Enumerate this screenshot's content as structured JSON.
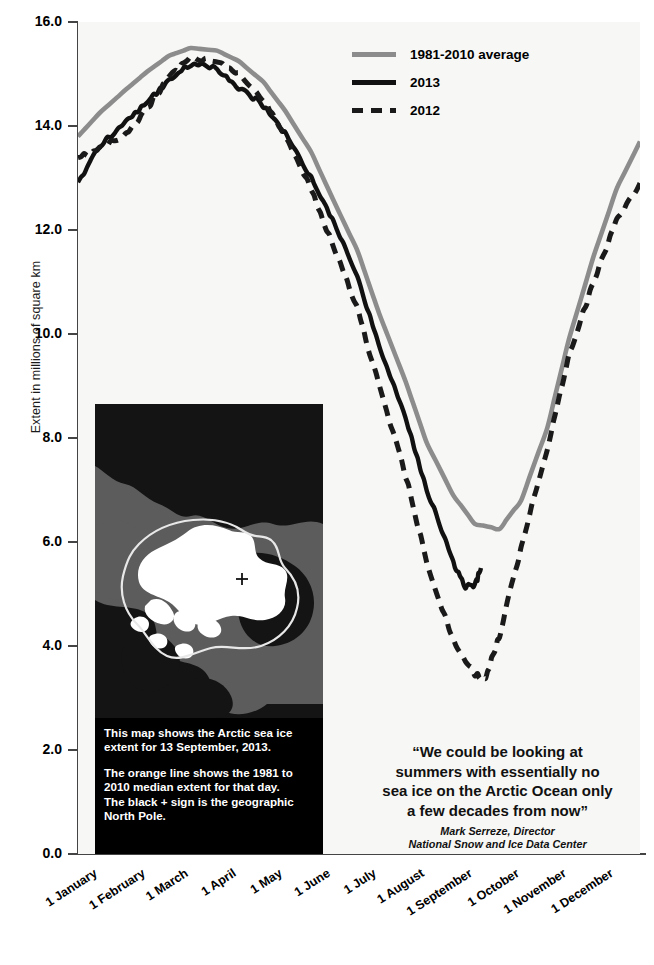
{
  "chart_data": {
    "type": "line",
    "title": "",
    "xlabel": "",
    "ylabel": "Extent in millions of square km",
    "ylim": [
      0.0,
      16.0
    ],
    "yticks": [
      "16.0",
      "14.0",
      "12.0",
      "10.0",
      "8.0",
      "6.0",
      "4.0",
      "2.0",
      "0.0"
    ],
    "ytick_values": [
      16.0,
      14.0,
      12.0,
      10.0,
      8.0,
      6.0,
      4.0,
      2.0,
      0.0
    ],
    "categories": [
      "1 January",
      "1 February",
      "1 March",
      "1 April",
      "1 May",
      "1 June",
      "1 July",
      "1 August",
      "1 September",
      "1 October",
      "1 November",
      "1 December"
    ],
    "x_day_of_year": [
      1,
      32,
      60,
      91,
      121,
      152,
      182,
      213,
      244,
      274,
      305,
      335
    ],
    "grid": false,
    "legend_position": "top-right",
    "series": [
      {
        "name": "1981-2010 average",
        "color": "#8c8c8c",
        "style": "solid",
        "x": [
          1,
          15,
          32,
          46,
          60,
          74,
          91,
          105,
          121,
          135,
          152,
          166,
          182,
          196,
          213,
          227,
          244,
          258,
          274,
          288,
          305,
          319,
          335,
          350,
          365
        ],
        "values": [
          13.8,
          14.25,
          14.7,
          15.05,
          15.35,
          15.5,
          15.45,
          15.25,
          14.85,
          14.3,
          13.5,
          12.6,
          11.6,
          10.4,
          9.1,
          7.9,
          6.9,
          6.35,
          6.25,
          6.8,
          8.2,
          9.9,
          11.5,
          12.8,
          13.7
        ]
      },
      {
        "name": "2013",
        "color": "#111111",
        "style": "solid",
        "x": [
          1,
          15,
          32,
          46,
          60,
          74,
          91,
          105,
          121,
          135,
          152,
          166,
          182,
          196,
          213,
          227,
          244,
          252,
          258,
          262
        ],
        "values": [
          12.9,
          13.6,
          14.1,
          14.45,
          14.9,
          15.2,
          15.1,
          14.75,
          14.4,
          13.85,
          13.0,
          12.2,
          11.1,
          9.75,
          8.4,
          7.0,
          5.6,
          5.15,
          5.15,
          5.5
        ]
      },
      {
        "name": "2012",
        "color": "#1a1a1a",
        "style": "dashed",
        "x": [
          1,
          15,
          32,
          46,
          60,
          74,
          91,
          105,
          121,
          135,
          152,
          166,
          182,
          196,
          213,
          227,
          244,
          258,
          265,
          274,
          288,
          305,
          319,
          335,
          350,
          365
        ],
        "values": [
          13.4,
          13.55,
          13.85,
          14.35,
          14.95,
          15.3,
          15.25,
          15.0,
          14.5,
          13.8,
          12.8,
          11.7,
          10.5,
          9.0,
          7.3,
          5.6,
          4.1,
          3.45,
          3.4,
          4.2,
          5.9,
          7.8,
          9.6,
          11.0,
          12.2,
          12.9
        ]
      }
    ]
  },
  "legend": {
    "items": [
      {
        "label": "1981-2010 average",
        "style": "solidgray"
      },
      {
        "label": "2013",
        "style": "solidblack"
      },
      {
        "label": "2012",
        "style": "dashed"
      }
    ]
  },
  "map_inset": {
    "caption_lines": [
      "This map shows the Arctic sea ice",
      "extent for 13 September, 2013.",
      "The orange line shows the 1981 to",
      "2010 median extent for that day.",
      "The black + sign is the geographic",
      "North Pole."
    ],
    "pole_marker": "+"
  },
  "quote": {
    "lines": [
      "“We could be looking at",
      "summers with essentially no",
      "sea ice on the Arctic Ocean only",
      "a few decades from now”"
    ],
    "attribution_name": "Mark Serreze, Director",
    "attribution_org": "National Snow and Ice Data Center"
  }
}
